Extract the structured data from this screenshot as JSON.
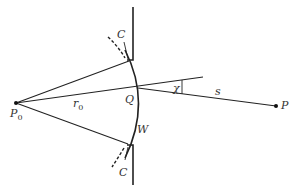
{
  "diagram": {
    "colors": {
      "stroke": "#222222",
      "label": "#333333",
      "background": "#ffffff"
    },
    "labels": {
      "source": "P",
      "source_sub": "0",
      "observation": "P",
      "aperture_point": "Q",
      "radius": "r",
      "radius_sub": "0",
      "distance": "s",
      "angle": "χ",
      "wavefront": "W",
      "screen_top": "C",
      "screen_bottom": "C"
    },
    "points": {
      "P0": [
        16,
        103
      ],
      "Q": [
        138,
        88
      ],
      "P": [
        276,
        106
      ],
      "aperture_top_corner": [
        132,
        60
      ],
      "aperture_bottom_corner": [
        132,
        145
      ]
    }
  }
}
